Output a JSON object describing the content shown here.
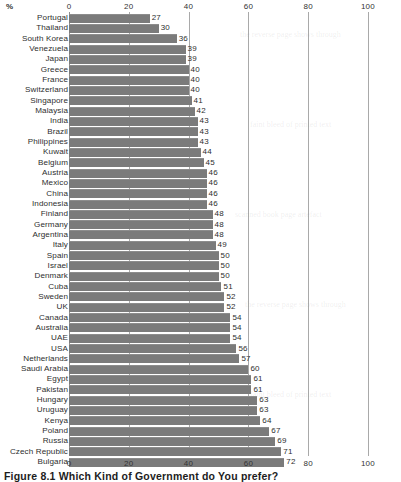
{
  "unit_label": "%",
  "caption": "Figure 8.1  Which Kind of Government do You prefer?",
  "axis": {
    "ticks": [
      0,
      20,
      40,
      60,
      80,
      100
    ],
    "min": 0,
    "max": 100,
    "top_ticks": [
      "0",
      "20",
      "40",
      "60",
      "80",
      "100"
    ],
    "bottom_ticks": [
      "0",
      "20",
      "40",
      "60",
      "80",
      "100"
    ]
  },
  "colors": {
    "bar": "#7b7b7b",
    "grid": "#a9a9a9",
    "text": "#2e2e2e",
    "background": "#ffffff"
  },
  "chart_data": {
    "type": "bar",
    "orientation": "horizontal",
    "title": "Figure 8.1  Which Kind of Government do You prefer?",
    "xlabel": "%",
    "ylabel": "",
    "xlim": [
      0,
      100
    ],
    "grid": true,
    "legend": false,
    "categories": [
      "Portugal",
      "Thailand",
      "South Korea",
      "Venezuela",
      "Japan",
      "Greece",
      "France",
      "Switzerland",
      "Singapore",
      "Malaysia",
      "India",
      "Brazil",
      "Philippines",
      "Kuwait",
      "Belgium",
      "Austria",
      "Mexico",
      "China",
      "Indonesia",
      "Finland",
      "Germany",
      "Argentina",
      "Italy",
      "Spain",
      "Israel",
      "Denmark",
      "Cuba",
      "Sweden",
      "UK",
      "Canada",
      "Australia",
      "UAE",
      "USA",
      "Netherlands",
      "Saudi Arabia",
      "Egypt",
      "Pakistan",
      "Hungary",
      "Uruguay",
      "Kenya",
      "Poland",
      "Russia",
      "Czech Republic",
      "Bulgaria"
    ],
    "values": [
      27,
      30,
      36,
      39,
      39,
      40,
      40,
      40,
      41,
      42,
      43,
      43,
      43,
      44,
      45,
      46,
      46,
      46,
      46,
      48,
      48,
      48,
      49,
      50,
      50,
      50,
      51,
      52,
      52,
      54,
      54,
      54,
      56,
      57,
      60,
      61,
      61,
      63,
      63,
      64,
      67,
      69,
      71,
      72
    ]
  },
  "ghost_text": [
    "the reverse page shows through",
    "faint bleed of printed text",
    "scanned book page artefact"
  ]
}
